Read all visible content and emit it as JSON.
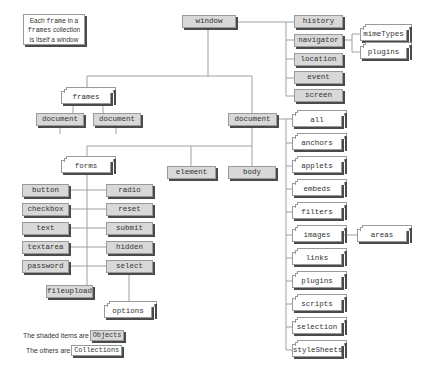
{
  "note": {
    "line1_pre": "Each ",
    "line1_code": "frame",
    "line1_post": " in a",
    "line2_code": "frames",
    "line2_post": " collection",
    "line3": "is itself a window"
  },
  "objects": {
    "window": "window",
    "history": "history",
    "navigator": "navigator",
    "location": "location",
    "event": "event",
    "screen": "screen",
    "document": "document",
    "frame_document_1": "document",
    "frame_document_2": "document",
    "element": "element",
    "body": "body",
    "button": "button",
    "checkbox": "checkbox",
    "text": "text",
    "textarea": "textarea",
    "password": "password",
    "radio": "radio",
    "reset": "reset",
    "submit": "submit",
    "hidden": "hidden",
    "select": "select",
    "fileupload": "fileupload"
  },
  "collections": {
    "mimeTypes": "mimeTypes",
    "navigator_plugins": "plugins",
    "frames": "frames",
    "forms": "forms",
    "options": "options",
    "all": "all",
    "anchors": "anchors",
    "applets": "applets",
    "embeds": "embeds",
    "filters": "filters",
    "images": "images",
    "areas": "areas",
    "links": "links",
    "plugins": "plugins",
    "scripts": "scripts",
    "selection": "selection",
    "styleSheets": "styleSheets"
  },
  "legend": {
    "objects_prefix": "The shaded items are",
    "objects_label": "Objects",
    "collections_prefix": "The others are",
    "collections_label": "Collections"
  },
  "colors": {
    "object_fill": "#d8d8d8",
    "collection_fill": "#ffffff",
    "border": "#9a9a9a",
    "shadow": "#4a4a4a",
    "line": "#a0a0a0"
  }
}
